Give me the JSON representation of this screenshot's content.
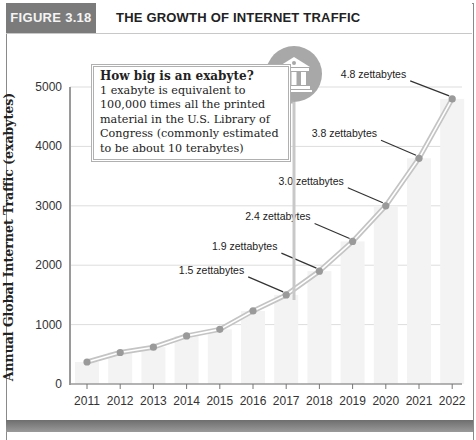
{
  "figure": {
    "badge": "FIGURE 3.18",
    "title": "THE GROWTH OF INTERNET TRAFFIC"
  },
  "callout": {
    "question": "How big is an exabyte?",
    "answer": "1 exabyte is equivalent to 100,000 times all the printed material in the U.S. Library of Congress (commonly estimated to be about 10 terabytes)",
    "icon": "library-building-icon"
  },
  "axis": {
    "ylabel": "Annual Global Internet Traffic (exabytes)",
    "yticks": [
      "0",
      "1000",
      "2000",
      "3000",
      "4000",
      "5000"
    ],
    "xticks": [
      "2011",
      "2012",
      "2013",
      "2014",
      "2015",
      "2016",
      "2017",
      "2018",
      "2019",
      "2020",
      "2021",
      "2022"
    ]
  },
  "annotations": [
    {
      "year": "2017",
      "label": "1.5 zettabytes"
    },
    {
      "year": "2018",
      "label": "1.9 zettabytes"
    },
    {
      "year": "2019",
      "label": "2.4 zettabytes"
    },
    {
      "year": "2020",
      "label": "3.0 zettabytes"
    },
    {
      "year": "2021",
      "label": "3.8 zettabytes"
    },
    {
      "year": "2022",
      "label": "4.8 zettabytes"
    }
  ],
  "colors": {
    "line": "#c8c8c8",
    "point": "#9a9a9a",
    "bar": "#f3f3f3",
    "grid": "#dddddd",
    "badge": "#7b7b7b"
  },
  "chart_data": {
    "type": "line",
    "title": "THE GROWTH OF INTERNET TRAFFIC",
    "xlabel": "",
    "ylabel": "Annual Global Internet Traffic (exabytes)",
    "categories": [
      "2011",
      "2012",
      "2013",
      "2014",
      "2015",
      "2016",
      "2017",
      "2018",
      "2019",
      "2020",
      "2021",
      "2022"
    ],
    "series": [
      {
        "name": "Annual Global Internet Traffic (exabytes)",
        "values": [
          370,
          530,
          620,
          810,
          920,
          1230,
          1500,
          1900,
          2400,
          3000,
          3800,
          4800
        ]
      }
    ],
    "ylim": [
      0,
      5000
    ],
    "yticks": [
      0,
      1000,
      2000,
      3000,
      4000,
      5000
    ],
    "grid": true,
    "legend": "none",
    "annotations": [
      {
        "x": "2017",
        "text": "1.5 zettabytes"
      },
      {
        "x": "2018",
        "text": "1.9 zettabytes"
      },
      {
        "x": "2019",
        "text": "2.4 zettabytes"
      },
      {
        "x": "2020",
        "text": "3.0 zettabytes"
      },
      {
        "x": "2021",
        "text": "3.8 zettabytes"
      },
      {
        "x": "2022",
        "text": "4.8 zettabytes"
      }
    ],
    "inset_note": "How big is an exabyte? 1 exabyte is equivalent to 100,000 times all the printed material in the U.S. Library of Congress (commonly estimated to be about 10 terabytes)"
  }
}
